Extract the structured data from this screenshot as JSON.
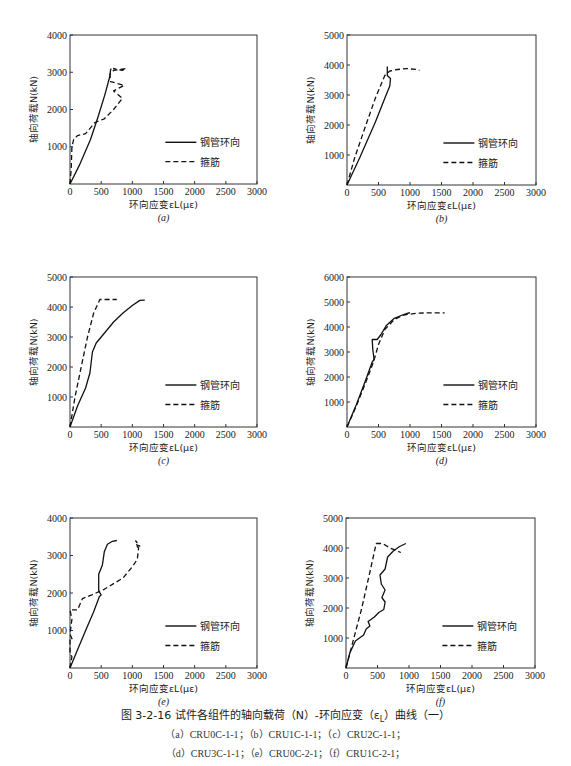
{
  "figure": {
    "title": "图 3-2-16  试件各组件的轴向载荷（N）-环向应变（ε",
    "title_sub": "L",
    "title_tail": "）曲线（一）",
    "caption_line1": "（a）CRU0C-1-1；（b）CRU1C-1-1；（c）CRU2C-1-1；",
    "caption_line2": "（d）CRU3C-1-1；（e）CRU0C-2-1；（f）CRU1C-2-1；"
  },
  "chart_data": [
    {
      "id": "a",
      "type": "line",
      "label": "(a)",
      "frame": {
        "x": 70,
        "y": 35,
        "w": 187,
        "h": 149
      },
      "xlabel": "环向应变εL(με)",
      "ylabel": "轴向荷载N(kN)",
      "xlim": [
        0,
        3000
      ],
      "ylim": [
        0,
        4000
      ],
      "xticks": [
        0,
        500,
        1000,
        1500,
        2000,
        2500,
        3000
      ],
      "yticks": [
        1000,
        2000,
        3000,
        4000
      ],
      "legend": [
        "钢管环向",
        "箍筋"
      ],
      "series": [
        {
          "name": "钢管环向",
          "style": "solid",
          "points": [
            [
              0,
              0
            ],
            [
              150,
              500
            ],
            [
              330,
              1200
            ],
            [
              450,
              1800
            ],
            [
              560,
              2400
            ],
            [
              640,
              2900
            ],
            [
              650,
              3050
            ],
            [
              660,
              3100
            ]
          ]
        },
        {
          "name": "箍筋",
          "style": "dashed",
          "points": [
            [
              0,
              0
            ],
            [
              20,
              400
            ],
            [
              30,
              1000
            ],
            [
              60,
              1200
            ],
            [
              120,
              1300
            ],
            [
              250,
              1350
            ],
            [
              400,
              1650
            ],
            [
              550,
              1750
            ],
            [
              700,
              2000
            ],
            [
              840,
              2300
            ],
            [
              700,
              2500
            ],
            [
              870,
              2650
            ],
            [
              650,
              2750
            ],
            [
              640,
              2950
            ],
            [
              700,
              3050
            ],
            [
              900,
              3100
            ],
            [
              840,
              3050
            ],
            [
              690,
              3100
            ]
          ]
        }
      ]
    },
    {
      "id": "b",
      "type": "line",
      "label": "(b)",
      "frame": {
        "x": 347,
        "y": 35,
        "w": 189,
        "h": 150
      },
      "xlabel": "环向应变εL(με)",
      "ylabel": "轴向荷载N(kN)",
      "xlim": [
        0,
        3000
      ],
      "ylim": [
        0,
        5000
      ],
      "xticks": [
        0,
        500,
        1000,
        1500,
        2000,
        2500,
        3000
      ],
      "yticks": [
        1000,
        2000,
        3000,
        4000,
        5000
      ],
      "legend": [
        "钢管环向",
        "箍筋"
      ],
      "series": [
        {
          "name": "钢管环向",
          "style": "solid",
          "points": [
            [
              0,
              0
            ],
            [
              200,
              900
            ],
            [
              450,
              2100
            ],
            [
              620,
              3000
            ],
            [
              680,
              3300
            ],
            [
              690,
              3550
            ],
            [
              640,
              3650
            ],
            [
              640,
              3950
            ]
          ]
        },
        {
          "name": "箍筋",
          "style": "dashed",
          "points": [
            [
              0,
              0
            ],
            [
              120,
              900
            ],
            [
              300,
              2000
            ],
            [
              450,
              2900
            ],
            [
              600,
              3650
            ],
            [
              680,
              3800
            ],
            [
              800,
              3850
            ],
            [
              950,
              3880
            ],
            [
              1100,
              3850
            ],
            [
              1150,
              3820
            ]
          ]
        }
      ]
    },
    {
      "id": "c",
      "type": "line",
      "label": "(c)",
      "frame": {
        "x": 70,
        "y": 277,
        "w": 187,
        "h": 150
      },
      "xlabel": "环向应变εL(με)",
      "ylabel": "轴向荷载N(kN)",
      "xlim": [
        0,
        3000
      ],
      "ylim": [
        0,
        5000
      ],
      "xticks": [
        0,
        500,
        1000,
        1500,
        2000,
        2500,
        3000
      ],
      "yticks": [
        1000,
        2000,
        3000,
        4000,
        5000
      ],
      "legend": [
        "钢管环向",
        "箍筋"
      ],
      "series": [
        {
          "name": "钢管环向",
          "style": "solid",
          "points": [
            [
              0,
              0
            ],
            [
              120,
              700
            ],
            [
              250,
              1300
            ],
            [
              320,
              1800
            ],
            [
              360,
              2500
            ],
            [
              420,
              2800
            ],
            [
              500,
              3000
            ],
            [
              600,
              3250
            ],
            [
              700,
              3500
            ],
            [
              850,
              3800
            ],
            [
              1000,
              4050
            ],
            [
              1120,
              4220
            ],
            [
              1200,
              4230
            ]
          ]
        },
        {
          "name": "箍筋",
          "style": "dashed",
          "points": [
            [
              0,
              0
            ],
            [
              80,
              1000
            ],
            [
              180,
              2000
            ],
            [
              280,
              3000
            ],
            [
              380,
              3800
            ],
            [
              480,
              4250
            ],
            [
              600,
              4250
            ],
            [
              750,
              4250
            ]
          ]
        }
      ]
    },
    {
      "id": "d",
      "type": "line",
      "label": "(d)",
      "frame": {
        "x": 347,
        "y": 277,
        "w": 189,
        "h": 150
      },
      "xlabel": "环向应变εL(με)",
      "ylabel": "轴向荷载N(kN)",
      "xlim": [
        0,
        3000
      ],
      "ylim": [
        0,
        6000
      ],
      "xticks": [
        0,
        500,
        1000,
        1500,
        2000,
        2500,
        3000
      ],
      "yticks": [
        1000,
        2000,
        3000,
        4000,
        5000,
        6000
      ],
      "legend": [
        "钢管环向",
        "箍筋"
      ],
      "series": [
        {
          "name": "钢管环向",
          "style": "solid",
          "points": [
            [
              0,
              0
            ],
            [
              150,
              900
            ],
            [
              300,
              1900
            ],
            [
              400,
              2600
            ],
            [
              430,
              2700
            ],
            [
              410,
              3100
            ],
            [
              400,
              3500
            ],
            [
              480,
              3500
            ],
            [
              540,
              3700
            ],
            [
              620,
              4050
            ],
            [
              750,
              4350
            ],
            [
              900,
              4500
            ],
            [
              980,
              4570
            ],
            [
              1000,
              4560
            ]
          ]
        },
        {
          "name": "箍筋",
          "style": "dashed",
          "points": [
            [
              0,
              0
            ],
            [
              150,
              850
            ],
            [
              300,
              1800
            ],
            [
              420,
              2600
            ],
            [
              500,
              3300
            ],
            [
              600,
              3900
            ],
            [
              750,
              4300
            ],
            [
              900,
              4480
            ],
            [
              1100,
              4550
            ],
            [
              1300,
              4570
            ],
            [
              1550,
              4570
            ]
          ]
        }
      ]
    },
    {
      "id": "e",
      "type": "line",
      "label": "(e)",
      "frame": {
        "x": 70,
        "y": 518,
        "w": 187,
        "h": 150
      },
      "xlabel": "环向应变εL(με)",
      "ylabel": "轴向荷载N(kN)",
      "xlim": [
        0,
        3000
      ],
      "ylim": [
        0,
        4000
      ],
      "xticks": [
        0,
        500,
        1000,
        1500,
        2000,
        2500,
        3000
      ],
      "yticks": [
        1000,
        2000,
        3000,
        4000
      ],
      "legend": [
        "钢管环向",
        "箍筋"
      ],
      "series": [
        {
          "name": "钢管环向",
          "style": "solid",
          "points": [
            [
              0,
              0
            ],
            [
              100,
              400
            ],
            [
              250,
              1000
            ],
            [
              380,
              1500
            ],
            [
              470,
              1900
            ],
            [
              500,
              1950
            ],
            [
              460,
              2050
            ],
            [
              460,
              2500
            ],
            [
              520,
              2750
            ],
            [
              550,
              3100
            ],
            [
              600,
              3300
            ],
            [
              680,
              3380
            ],
            [
              750,
              3400
            ]
          ]
        },
        {
          "name": "箍筋",
          "style": "dashed",
          "points": [
            [
              0,
              0
            ],
            [
              30,
              300
            ],
            [
              0,
              400
            ],
            [
              0,
              750
            ],
            [
              40,
              750
            ],
            [
              0,
              900
            ],
            [
              30,
              1300
            ],
            [
              0,
              1550
            ],
            [
              120,
              1550
            ],
            [
              200,
              1850
            ],
            [
              350,
              1950
            ],
            [
              550,
              2100
            ],
            [
              700,
              2250
            ],
            [
              850,
              2400
            ],
            [
              1000,
              2700
            ],
            [
              1080,
              2900
            ],
            [
              1100,
              3200
            ],
            [
              1050,
              3300
            ],
            [
              1120,
              3250
            ],
            [
              1050,
              3400
            ]
          ]
        }
      ]
    },
    {
      "id": "f",
      "type": "line",
      "label": "(f)",
      "frame": {
        "x": 346,
        "y": 518,
        "w": 189,
        "h": 150
      },
      "xlabel": "环向应变εL(με)",
      "ylabel": "轴向荷载N(kN)",
      "xlim": [
        0,
        3000
      ],
      "ylim": [
        0,
        5000
      ],
      "xticks": [
        0,
        500,
        1000,
        1500,
        2000,
        2500,
        3000
      ],
      "yticks": [
        1000,
        2000,
        3000,
        4000,
        5000
      ],
      "legend": [
        "钢管环向",
        "箍筋"
      ],
      "series": [
        {
          "name": "钢管环向",
          "style": "solid",
          "points": [
            [
              0,
              0
            ],
            [
              60,
              500
            ],
            [
              150,
              900
            ],
            [
              280,
              1100
            ],
            [
              320,
              1300
            ],
            [
              380,
              1400
            ],
            [
              350,
              1550
            ],
            [
              450,
              1700
            ],
            [
              520,
              1850
            ],
            [
              600,
              1950
            ],
            [
              620,
              2200
            ],
            [
              570,
              2350
            ],
            [
              620,
              2600
            ],
            [
              560,
              2800
            ],
            [
              540,
              3100
            ],
            [
              620,
              3300
            ],
            [
              660,
              3700
            ],
            [
              750,
              3900
            ],
            [
              850,
              4050
            ],
            [
              950,
              4150
            ]
          ]
        },
        {
          "name": "箍筋",
          "style": "dashed",
          "points": [
            [
              0,
              0
            ],
            [
              100,
              800
            ],
            [
              250,
              2000
            ],
            [
              380,
              3200
            ],
            [
              480,
              4150
            ],
            [
              580,
              4150
            ],
            [
              700,
              4000
            ],
            [
              870,
              3850
            ]
          ]
        }
      ]
    }
  ]
}
